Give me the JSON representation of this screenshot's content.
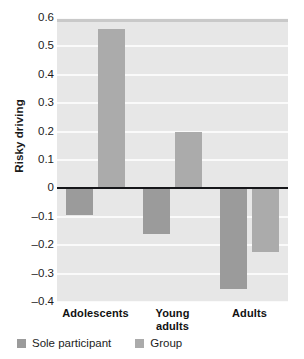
{
  "chart_data": {
    "type": "bar",
    "title": "",
    "xlabel": "",
    "ylabel": "Risky driving",
    "ylim": [
      -0.4,
      0.6
    ],
    "yticks": [
      "0.6",
      "0.5",
      "0.4",
      "0.3",
      "0.2",
      "0.1",
      "0",
      "–0.1",
      "–0.2",
      "–0.3",
      "–0.4"
    ],
    "ytick_values": [
      0.6,
      0.5,
      0.4,
      0.3,
      0.2,
      0.1,
      0,
      -0.1,
      -0.2,
      -0.3,
      -0.4
    ],
    "grid": true,
    "legend_position": "bottom-left",
    "categories": [
      "Adolescents",
      "Young adults",
      "Adults"
    ],
    "category_lines": [
      [
        "Adolescents"
      ],
      [
        "Young",
        "adults"
      ],
      [
        "Adults"
      ]
    ],
    "series": [
      {
        "name": "Sole participant",
        "color": "#9b9b9b",
        "values": [
          -0.095,
          -0.16,
          -0.355
        ]
      },
      {
        "name": "Group",
        "color": "#ababab",
        "values": [
          0.56,
          0.2,
          -0.225
        ]
      }
    ],
    "plot_background": "#e7e7e7",
    "gridline_color": "#fafafa",
    "zeroline_color": "#16171a"
  },
  "legend": {
    "items": [
      {
        "label": "Sole participant",
        "swatch": "sole"
      },
      {
        "label": "Group",
        "swatch": "group"
      }
    ]
  }
}
